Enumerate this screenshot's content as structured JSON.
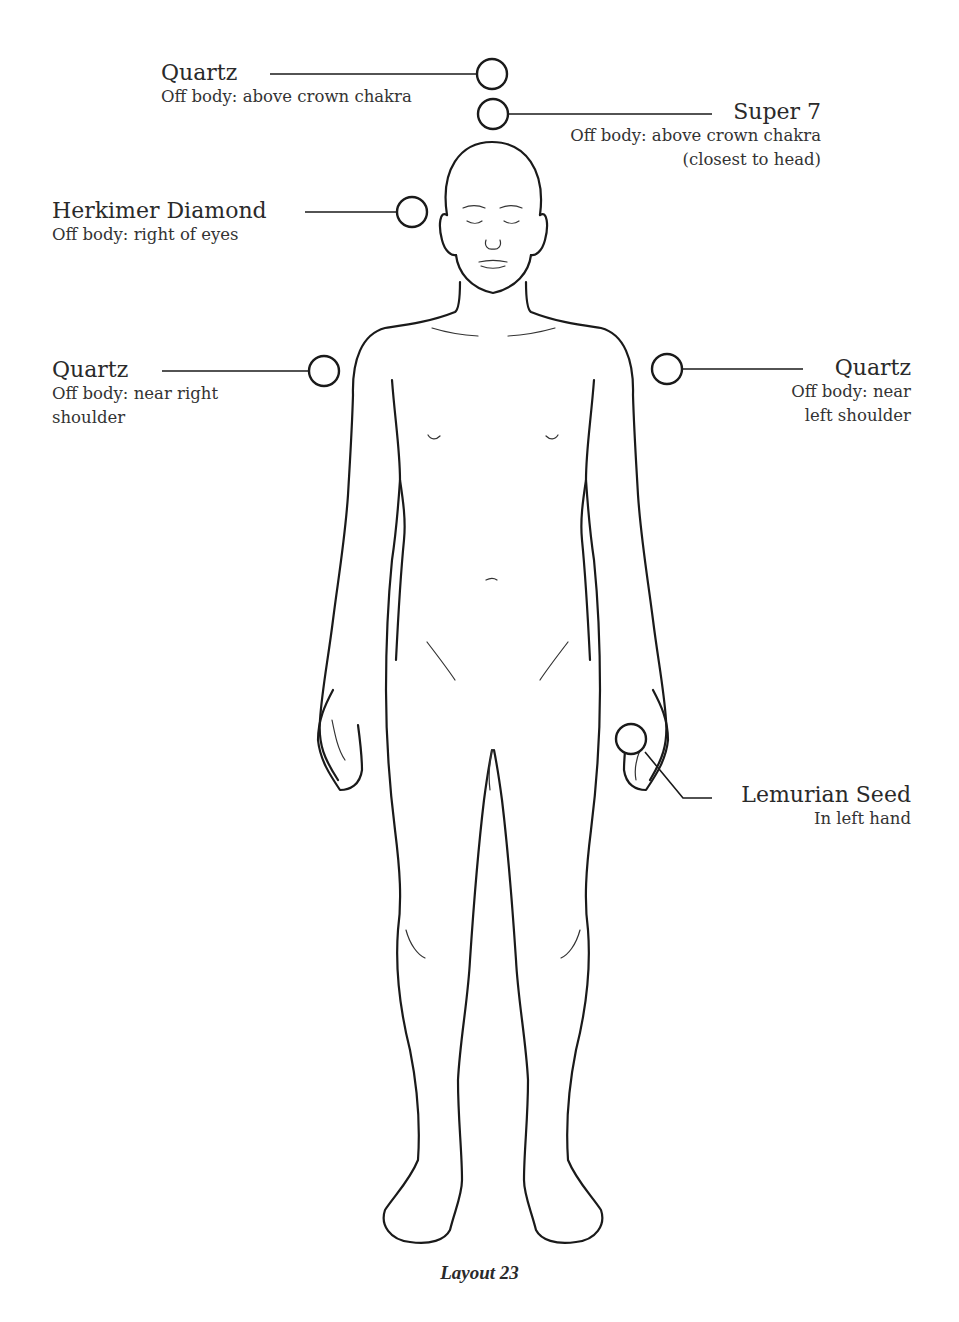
{
  "figure": {
    "caption": "Layout 23",
    "placements": [
      {
        "id": "quartz-crown",
        "name": "Quartz",
        "desc": [
          "Off body: above crown chakra"
        ],
        "side": "left"
      },
      {
        "id": "super7-crown",
        "name": "Super 7",
        "desc": [
          "Off body: above crown chakra",
          "(closest to head)"
        ],
        "side": "right"
      },
      {
        "id": "herkimer-eyes",
        "name": "Herkimer Diamond",
        "desc": [
          "Off body: right of eyes"
        ],
        "side": "left"
      },
      {
        "id": "quartz-right-shoulder",
        "name": "Quartz",
        "desc": [
          "Off body: near right",
          "shoulder"
        ],
        "side": "left"
      },
      {
        "id": "quartz-left-shoulder",
        "name": "Quartz",
        "desc": [
          "Off body: near",
          "left shoulder"
        ],
        "side": "right"
      },
      {
        "id": "lemurian-left-hand",
        "name": "Lemurian Seed",
        "desc": [
          "In left hand"
        ],
        "side": "right"
      }
    ],
    "colors": {
      "ink": "#1a1a1a",
      "background": "#ffffff"
    }
  }
}
